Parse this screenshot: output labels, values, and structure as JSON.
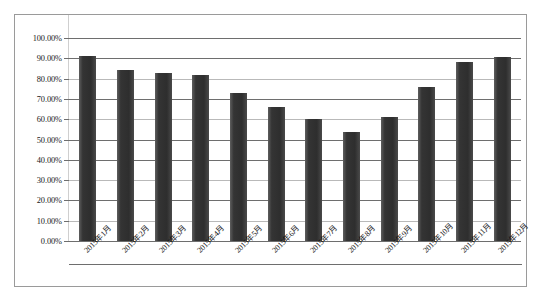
{
  "chart_data": {
    "type": "bar",
    "title": "",
    "xlabel": "",
    "ylabel": "",
    "categories": [
      "2015年1月",
      "2015年2月",
      "2015年3月",
      "2015年4月",
      "2015年5月",
      "2015年6月",
      "2015年7月",
      "2015年8月",
      "2015年9月",
      "2015年10月",
      "2015年11月",
      "2015年12月"
    ],
    "values": [
      91.0,
      84.0,
      83.0,
      82.0,
      73.0,
      66.0,
      60.0,
      53.5,
      61.0,
      76.0,
      88.0,
      90.5
    ],
    "value_unit": "%",
    "ylim": [
      0,
      100
    ],
    "ytick_values": [
      100,
      90,
      80,
      70,
      60,
      50,
      40,
      30,
      20,
      10,
      0
    ],
    "ytick_labels": [
      "100.00%",
      "90.00%",
      "80.00%",
      "70.00%",
      "60.00%",
      "50.00%",
      "40.00%",
      "30.00%",
      "20.00%",
      "10.00%",
      "0.00%"
    ],
    "grid": true,
    "legend": "none",
    "series_color": "#3a3a3a",
    "grid_color": "#6e6e6e",
    "frame_color": "#9a9a9a",
    "background": "#ffffff"
  }
}
